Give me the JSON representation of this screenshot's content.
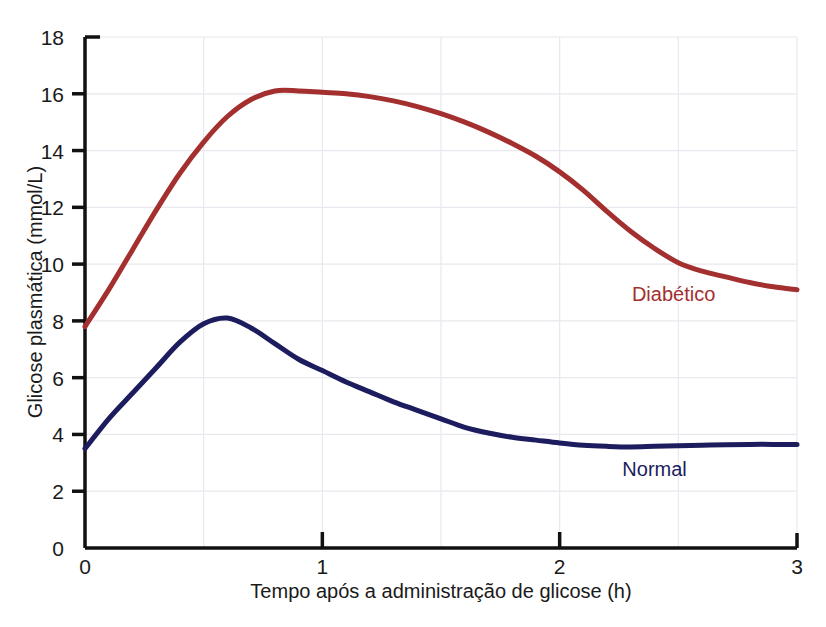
{
  "chart_data": {
    "type": "line",
    "title": "",
    "xlabel": "Tempo após a administração de glicose (h)",
    "ylabel": "Glicose plasmática (mmol/L)",
    "xlim": [
      0,
      3
    ],
    "ylim": [
      0,
      18
    ],
    "xticks": [
      "0",
      "1",
      "2",
      "3"
    ],
    "xtick_values": [
      0,
      1,
      2,
      3
    ],
    "yticks": [
      "0",
      "2",
      "4",
      "6",
      "8",
      "10",
      "12",
      "14",
      "16",
      "18"
    ],
    "ytick_values": [
      0,
      2,
      4,
      6,
      8,
      10,
      12,
      14,
      16,
      18
    ],
    "grid": true,
    "grid_x_step": 0.5,
    "grid_y_step": 2,
    "legend": "inline-labels",
    "series": [
      {
        "name": "Diabético",
        "color": "#a32f2f",
        "label_x": 2.48,
        "label_y": 8.7,
        "x": [
          0.0,
          0.1,
          0.2,
          0.3,
          0.4,
          0.5,
          0.6,
          0.7,
          0.8,
          0.9,
          1.0,
          1.1,
          1.2,
          1.3,
          1.4,
          1.5,
          1.6,
          1.7,
          1.8,
          1.9,
          2.0,
          2.1,
          2.2,
          2.3,
          2.4,
          2.5,
          2.6,
          2.7,
          2.8,
          2.9,
          3.0
        ],
        "y": [
          7.8,
          9.1,
          10.5,
          11.9,
          13.2,
          14.3,
          15.2,
          15.8,
          16.1,
          16.1,
          16.05,
          16.0,
          15.9,
          15.75,
          15.55,
          15.3,
          15.0,
          14.65,
          14.25,
          13.8,
          13.25,
          12.6,
          11.85,
          11.15,
          10.55,
          10.05,
          9.75,
          9.55,
          9.35,
          9.2,
          9.1
        ]
      },
      {
        "name": "Normal",
        "color": "#1c1c5e",
        "label_x": 2.4,
        "label_y": 2.55,
        "x": [
          0.0,
          0.1,
          0.2,
          0.3,
          0.4,
          0.5,
          0.6,
          0.7,
          0.8,
          0.9,
          1.0,
          1.1,
          1.2,
          1.3,
          1.4,
          1.5,
          1.6,
          1.7,
          1.8,
          1.9,
          2.0,
          2.1,
          2.2,
          2.3,
          2.4,
          2.5,
          2.6,
          2.7,
          2.8,
          2.9,
          3.0
        ],
        "y": [
          3.5,
          4.55,
          5.45,
          6.35,
          7.25,
          7.9,
          8.1,
          7.75,
          7.2,
          6.65,
          6.25,
          5.85,
          5.5,
          5.15,
          4.85,
          4.55,
          4.25,
          4.05,
          3.9,
          3.8,
          3.7,
          3.62,
          3.58,
          3.56,
          3.58,
          3.6,
          3.62,
          3.64,
          3.65,
          3.65,
          3.65
        ]
      }
    ]
  },
  "axes": {
    "axis_color": "#111111",
    "grid_color": "#e8e8ee",
    "background": "#ffffff"
  }
}
